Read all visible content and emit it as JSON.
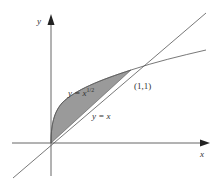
{
  "figure": {
    "type": "area-between-curves",
    "axes": {
      "x_label": "x",
      "y_label": "y"
    },
    "curves": [
      {
        "name": "sqrt-curve",
        "label_prefix": "y = x",
        "label_exponent": "1/2",
        "equation": "y = x^(1/2)"
      },
      {
        "name": "line",
        "label": "y = x",
        "equation": "y = x"
      }
    ],
    "intersection_point": {
      "label": "(1,1)",
      "x": 1,
      "y": 1
    },
    "shaded_region": {
      "between": [
        "y = x^(1/2)",
        "y = x"
      ],
      "x_range": [
        0,
        1
      ],
      "fill": "#9a9a9a"
    },
    "colors": {
      "stroke": "#555555",
      "fill": "#9a9a9a",
      "background": "#ffffff"
    }
  }
}
